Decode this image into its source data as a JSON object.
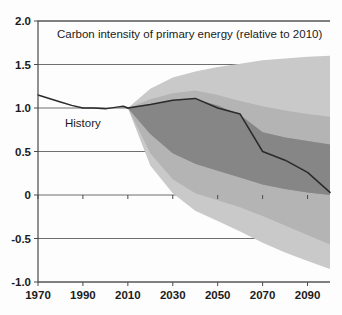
{
  "chart_data": {
    "type": "area",
    "title": "Carbon intensity of primary energy (relative to 2010)",
    "xlabel": "",
    "ylabel": "",
    "xlim": [
      1970,
      2100
    ],
    "ylim": [
      -1.0,
      2.0
    ],
    "grid": true,
    "legend_position": "none",
    "xticks": [
      1970,
      1990,
      2010,
      2030,
      2050,
      2070,
      2090
    ],
    "yticks": [
      "2.0",
      "1.5",
      "1.0",
      "0.5",
      "0",
      "-0.5",
      "-1.0"
    ],
    "ytick_values": [
      2.0,
      1.5,
      1.0,
      0.5,
      0,
      -0.5,
      -1.0
    ],
    "annotations": [
      {
        "text": "History",
        "x": 1982,
        "y": 0.78
      }
    ],
    "x": [
      2010,
      2020,
      2030,
      2040,
      2050,
      2060,
      2070,
      2080,
      2090,
      2100
    ],
    "history": {
      "name": "History",
      "x": [
        1970,
        1975,
        1980,
        1985,
        1990,
        1995,
        2000,
        2005,
        2008,
        2010
      ],
      "values": [
        1.15,
        1.11,
        1.07,
        1.03,
        1.0,
        1.0,
        0.99,
        1.01,
        1.02,
        1.0
      ]
    },
    "series": [
      {
        "name": "Outer band upper (95th percentile)",
        "color": "#c9c9c9",
        "values": [
          1.0,
          1.22,
          1.35,
          1.42,
          1.47,
          1.51,
          1.55,
          1.57,
          1.59,
          1.6
        ]
      },
      {
        "name": "Mid band upper (75th percentile)",
        "color": "#b4b4b4",
        "values": [
          1.0,
          1.1,
          1.17,
          1.2,
          1.15,
          1.08,
          1.02,
          0.97,
          0.93,
          0.9
        ]
      },
      {
        "name": "Inner band upper (median-high)",
        "color": "#a0a0a0",
        "values": [
          1.0,
          1.03,
          1.07,
          1.1,
          1.03,
          0.92,
          0.72,
          0.66,
          0.62,
          0.58
        ]
      },
      {
        "name": "Median",
        "color": "#2a2a2a",
        "values": [
          1.0,
          1.04,
          1.09,
          1.11,
          1.0,
          0.93,
          0.5,
          0.4,
          0.26,
          0.03
        ]
      },
      {
        "name": "Inner band lower (median-low)",
        "color": "#8a8a8a",
        "values": [
          1.0,
          0.7,
          0.48,
          0.36,
          0.28,
          0.2,
          0.12,
          0.07,
          0.03,
          0.0
        ]
      },
      {
        "name": "Mid band lower (25th percentile)",
        "color": "#9a9a9a",
        "values": [
          1.0,
          0.48,
          0.18,
          0.02,
          -0.06,
          -0.14,
          -0.24,
          -0.35,
          -0.46,
          -0.57
        ]
      },
      {
        "name": "Outer band lower (5th percentile)",
        "color": "#b0b0b0",
        "values": [
          1.0,
          0.34,
          0.02,
          -0.18,
          -0.3,
          -0.42,
          -0.55,
          -0.66,
          -0.76,
          -0.85
        ]
      }
    ]
  },
  "colors": {
    "band_outer": "#c9c9c9",
    "band_mid": "#b4b4b4",
    "band_inner": "#9b9b9b",
    "band_core": "#868686",
    "median_line": "#2a2a2a",
    "axis": "#4a4a4a",
    "grid": "#6f6f6f",
    "background": "#fdfdfd"
  }
}
